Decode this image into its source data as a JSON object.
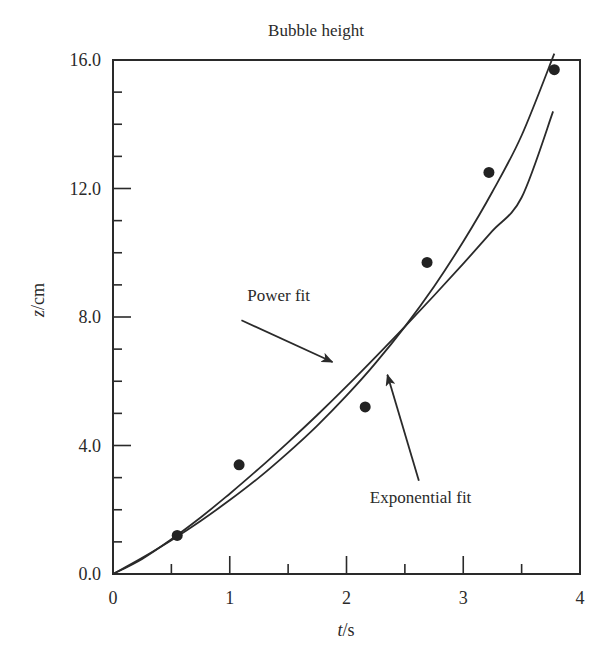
{
  "chart_data": {
    "type": "scatter",
    "title": "Bubble height",
    "xlabel_italic": "t",
    "xlabel_unit": "/s",
    "ylabel_italic": "z",
    "ylabel_unit": "/cm",
    "xlim": [
      0,
      4
    ],
    "ylim": [
      0,
      16
    ],
    "x_ticks": [
      0,
      1,
      2,
      3,
      4
    ],
    "x_tick_labels": [
      "0",
      "1",
      "2",
      "3",
      "4"
    ],
    "x_minor_ticks": [
      0.5,
      1.5,
      2.5,
      3.5
    ],
    "y_ticks": [
      0,
      4,
      8,
      12,
      16
    ],
    "y_tick_labels": [
      "0.0",
      "4.0",
      "8.0",
      "12.0",
      "16.0"
    ],
    "y_minor_ticks": [
      1,
      2,
      3,
      5,
      6,
      7,
      9,
      10,
      11,
      13,
      14,
      15
    ],
    "grid": false,
    "legend": "none (annotations with arrows)",
    "series": [
      {
        "name": "Measured data",
        "kind": "points",
        "x": [
          0.55,
          1.08,
          2.16,
          2.69,
          3.22,
          3.78
        ],
        "y": [
          1.2,
          3.4,
          5.2,
          9.7,
          12.5,
          15.7
        ]
      },
      {
        "name": "Power fit",
        "kind": "line",
        "x": [
          0.0,
          0.25,
          0.5,
          0.75,
          1.0,
          1.25,
          1.5,
          1.75,
          2.0,
          2.25,
          2.5,
          2.75,
          3.0,
          3.25,
          3.5,
          3.77
        ],
        "y": [
          0.0,
          0.47,
          1.08,
          1.76,
          2.5,
          3.28,
          4.1,
          4.95,
          5.84,
          6.76,
          7.7,
          8.67,
          9.66,
          10.68,
          11.72,
          14.4
        ]
      },
      {
        "name": "Exponential fit",
        "kind": "line",
        "x": [
          0.0,
          0.25,
          0.5,
          0.75,
          1.0,
          1.25,
          1.5,
          1.75,
          2.0,
          2.25,
          2.5,
          2.75,
          3.0,
          3.25,
          3.5,
          3.78
        ],
        "y": [
          0.0,
          0.5,
          1.05,
          1.65,
          2.3,
          3.0,
          3.78,
          4.62,
          5.55,
          6.57,
          7.7,
          8.95,
          10.35,
          11.9,
          13.65,
          16.2
        ]
      }
    ],
    "annotations": [
      {
        "text": "Power fit",
        "text_at": [
          1.15,
          8.5
        ],
        "arrow_from": [
          1.1,
          7.9
        ],
        "arrow_to": [
          1.88,
          6.6
        ]
      },
      {
        "text": "Exponential fit",
        "text_at": [
          2.2,
          2.2
        ],
        "arrow_from": [
          2.62,
          2.9
        ],
        "arrow_to": [
          2.35,
          6.2
        ]
      }
    ]
  }
}
